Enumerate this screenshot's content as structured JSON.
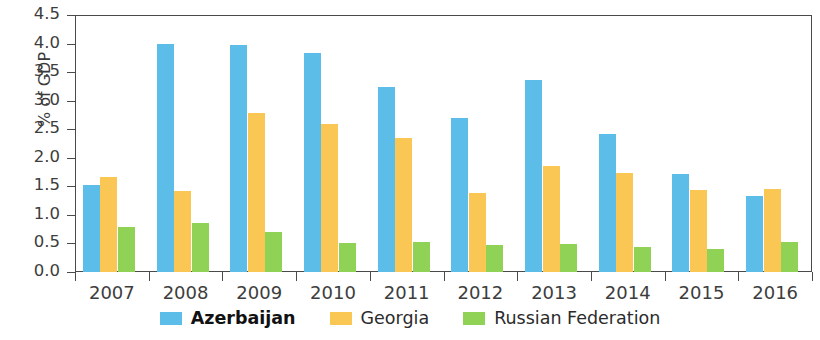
{
  "chart_data": {
    "type": "bar",
    "title": "",
    "subtitle": "",
    "xlabel": "",
    "ylabel": "% of GDP",
    "categories": [
      "2007",
      "2008",
      "2009",
      "2010",
      "2011",
      "2012",
      "2013",
      "2014",
      "2015",
      "2016"
    ],
    "ylim": [
      0,
      4.5
    ],
    "ytick_labels": [
      "0.0",
      "0.5",
      "1.0",
      "1.5",
      "2.0",
      "2.5",
      "3.0",
      "3.5",
      "4.0",
      "4.5"
    ],
    "ytick_values": [
      0.0,
      0.5,
      1.0,
      1.5,
      2.0,
      2.5,
      3.0,
      3.5,
      4.0,
      4.5
    ],
    "grid": false,
    "legend_position": "bottom",
    "series": [
      {
        "name": "Azerbaijan",
        "color": "#5BBDE8",
        "emphasis": "bold",
        "values": [
          1.52,
          3.99,
          3.97,
          3.83,
          3.24,
          2.69,
          3.36,
          2.41,
          1.71,
          1.33
        ]
      },
      {
        "name": "Georgia",
        "color": "#FAC654",
        "emphasis": "normal",
        "values": [
          1.66,
          1.41,
          2.79,
          2.6,
          2.35,
          1.38,
          1.86,
          1.73,
          1.43,
          1.46
        ]
      },
      {
        "name": "Russian Federation",
        "color": "#8FD255",
        "emphasis": "normal",
        "values": [
          0.79,
          0.86,
          0.7,
          0.5,
          0.52,
          0.47,
          0.49,
          0.44,
          0.4,
          0.53
        ]
      }
    ]
  },
  "colors": {
    "azerbaijan": "#5BBDE8",
    "georgia": "#FAC654",
    "russian_federation": "#8FD255",
    "axis": "#4a4a4a",
    "text": "#3d3d3d"
  }
}
